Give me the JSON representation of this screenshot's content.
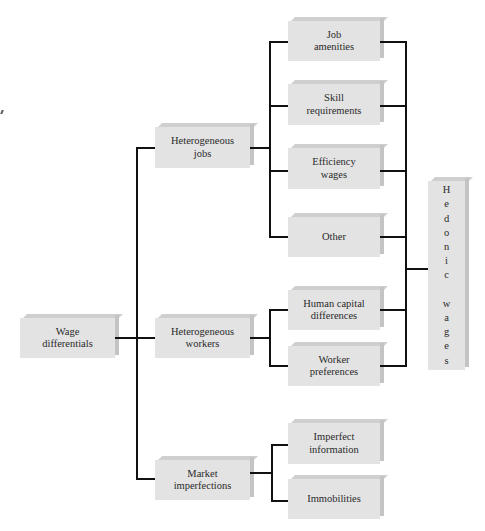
{
  "diagram": {
    "root": {
      "id": "wage-differentials",
      "label": "Wage\ndifferentials"
    },
    "level1": [
      {
        "id": "heterogeneous-jobs",
        "label": "Heterogeneous\njobs"
      },
      {
        "id": "heterogeneous-workers",
        "label": "Heterogeneous\nworkers"
      },
      {
        "id": "market-imperfections",
        "label": "Market\nimperfections"
      }
    ],
    "level2": {
      "heterogeneous_jobs": [
        {
          "id": "job-amenities",
          "label": "Job\namenities"
        },
        {
          "id": "skill-requirements",
          "label": "Skill\nrequirements"
        },
        {
          "id": "efficiency-wages",
          "label": "Efficiency\nwages"
        },
        {
          "id": "other",
          "label": "Other"
        }
      ],
      "heterogeneous_workers": [
        {
          "id": "human-capital-differences",
          "label": "Human capital\ndifferences"
        },
        {
          "id": "worker-preferences",
          "label": "Worker\npreferences"
        }
      ],
      "market_imperfections": [
        {
          "id": "imperfect-information",
          "label": "Imperfect\ninformation"
        },
        {
          "id": "immobilities",
          "label": "Immobilities"
        }
      ]
    },
    "result": {
      "id": "hedonic-wages",
      "label": "H\ne\nd\no\nn\ni\nc\n\nw\na\ng\ne\ns"
    },
    "edges": [
      [
        "wage-differentials",
        "heterogeneous-jobs"
      ],
      [
        "wage-differentials",
        "heterogeneous-workers"
      ],
      [
        "wage-differentials",
        "market-imperfections"
      ],
      [
        "heterogeneous-jobs",
        "job-amenities"
      ],
      [
        "heterogeneous-jobs",
        "skill-requirements"
      ],
      [
        "heterogeneous-jobs",
        "efficiency-wages"
      ],
      [
        "heterogeneous-jobs",
        "other"
      ],
      [
        "heterogeneous-workers",
        "human-capital-differences"
      ],
      [
        "heterogeneous-workers",
        "worker-preferences"
      ],
      [
        "market-imperfections",
        "imperfect-information"
      ],
      [
        "market-imperfections",
        "immobilities"
      ],
      [
        "job-amenities",
        "hedonic-wages"
      ],
      [
        "skill-requirements",
        "hedonic-wages"
      ],
      [
        "efficiency-wages",
        "hedonic-wages"
      ],
      [
        "other",
        "hedonic-wages"
      ],
      [
        "human-capital-differences",
        "hedonic-wages"
      ],
      [
        "worker-preferences",
        "hedonic-wages"
      ]
    ],
    "colors": {
      "box_face": "#e3e3e3",
      "box_top": "#cfcfcf",
      "box_side": "#c4c4c4",
      "line": "#111111",
      "text": "#2a2a2a"
    }
  }
}
